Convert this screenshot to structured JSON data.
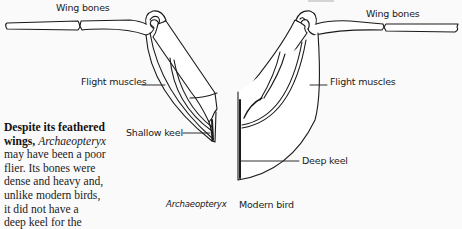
{
  "diagram": {
    "labels": {
      "wing_bones_left": "Wing bones",
      "wing_bones_right": "Wing bones",
      "flight_muscles_left": "Flight muscles",
      "flight_muscles_right": "Flight muscles",
      "shallow_keel": "Shallow keel",
      "deep_keel": "Deep keel"
    },
    "captions": {
      "left": "Archaeopteryx",
      "right": "Modern bird"
    },
    "colors": {
      "background": "#fafafa",
      "line": "#1a1a1a",
      "fill": "#ffffff"
    }
  },
  "sidebar_text": {
    "lead_bold": "Despite its feathered wings,",
    "lead_line1": "Despite its feathered",
    "lead_line2_bold": "wings,",
    "lead_line2_italic": "Archaeopteryx",
    "lines": [
      "may have been a poor",
      "flier. Its bones were",
      "dense and heavy and,",
      "unlike modern birds,",
      "it did not have a",
      "deep keel for the",
      "attachment of strong"
    ]
  }
}
